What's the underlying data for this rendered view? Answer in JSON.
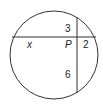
{
  "diagram": {
    "type": "intersecting-chords",
    "circle": {
      "cx": 54,
      "cy": 55,
      "r": 44
    },
    "point": {
      "label": "P"
    },
    "segments": {
      "left": "x",
      "right": "2",
      "top": "3",
      "bottom": "6"
    },
    "colors": {
      "stroke": "#333333",
      "text": "#222222"
    }
  }
}
